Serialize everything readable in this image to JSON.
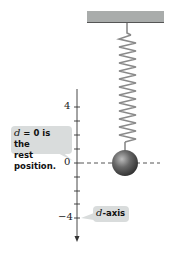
{
  "diagram": {
    "type": "spring-mass-system",
    "axis": {
      "name": "d-axis",
      "tick_labels": [
        {
          "value": "4",
          "y": 107
        },
        {
          "value": "0",
          "y": 163
        },
        {
          "value": "−4",
          "y": 218
        }
      ],
      "tick_step_px": 13.9
    },
    "callouts": {
      "rest_position": {
        "var": "d",
        "text_line1": " = 0 is the",
        "text_line2": "rest position."
      },
      "axis_label": {
        "var": "d",
        "text": "-axis"
      }
    },
    "colors": {
      "ceiling": "#a9acab",
      "ceiling_edge": "#555555",
      "spring": "#8a8a8a",
      "ball": "#555555",
      "callout_bg": "#d9dcdc",
      "axis": "#333333"
    }
  }
}
